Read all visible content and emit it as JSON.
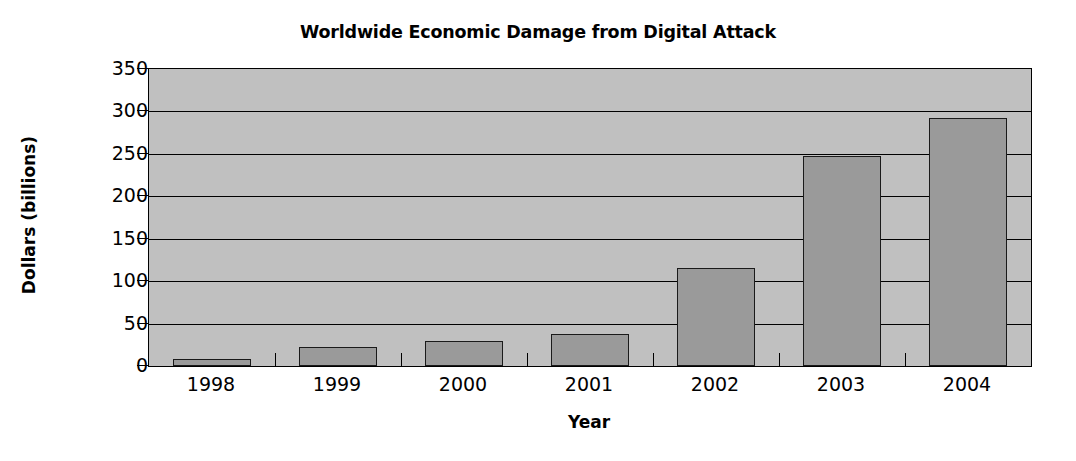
{
  "chart_data": {
    "type": "bar",
    "title": "Worldwide Economic Damage from Digital Attack",
    "xlabel": "Year",
    "ylabel": "Dollars (billions)",
    "categories": [
      "1998",
      "1999",
      "2000",
      "2001",
      "2002",
      "2003",
      "2004"
    ],
    "values": [
      8,
      22,
      29,
      38,
      116,
      248,
      292
    ],
    "ylim": [
      0,
      350
    ],
    "ytick_labels": [
      "0",
      "50",
      "100",
      "150",
      "200",
      "250",
      "300",
      "350"
    ],
    "ytick_values": [
      0,
      50,
      100,
      150,
      200,
      250,
      300,
      350
    ],
    "grid": true,
    "legend": false,
    "legend_position": "none",
    "series": [
      {
        "name": "Economic damage",
        "values": [
          8,
          22,
          29,
          38,
          116,
          248,
          292
        ]
      }
    ],
    "colors": {
      "bar_fill": "#9a9a9a",
      "bar_edge": "#1a1a1a",
      "plot_background": "#c0c0c0",
      "gridline": "#000000",
      "text": "#000000",
      "figure_background": "#ffffff"
    }
  }
}
